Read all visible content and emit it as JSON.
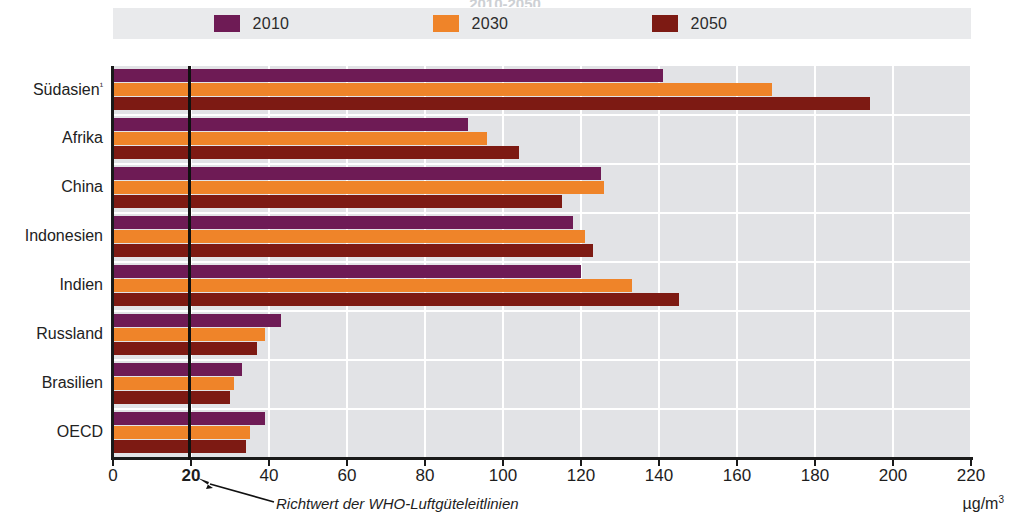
{
  "title_remnant": "2010-2050",
  "legend": {
    "items": [
      {
        "label": "2010",
        "color": "#6e1b55",
        "icon": "legend-swatch-icon"
      },
      {
        "label": "2030",
        "color": "#ef8429",
        "icon": "legend-swatch-icon"
      },
      {
        "label": "2050",
        "color": "#7d1a13",
        "icon": "legend-swatch-icon"
      }
    ]
  },
  "annotation": {
    "text": "Richtwert der WHO-Luftgüteleitlinien",
    "reference_value": 20,
    "arrow_icon": "arrow-up-left-icon"
  },
  "unit": "µg/m",
  "unit_exponent": "3",
  "axis": {
    "x_ticks": [
      "0",
      "20",
      "40",
      "60",
      "80",
      "100",
      "120",
      "140",
      "160",
      "180",
      "200",
      "220"
    ],
    "x_bold_tick": "20"
  },
  "chart_data": {
    "type": "bar",
    "orientation": "horizontal",
    "title": "",
    "xlabel": "µg/m³",
    "ylabel": "",
    "xlim": [
      0,
      220
    ],
    "xtick_step": 20,
    "grid": true,
    "legend_position": "top",
    "categories": [
      "Südasien¹",
      "Afrika",
      "China",
      "Indonesien",
      "Indien",
      "Russland",
      "Brasilien",
      "OECD"
    ],
    "series": [
      {
        "name": "2010",
        "color": "#6e1b55",
        "values": [
          141,
          91,
          125,
          118,
          120,
          43,
          33,
          39
        ]
      },
      {
        "name": "2030",
        "color": "#ef8429",
        "values": [
          169,
          96,
          126,
          121,
          133,
          39,
          31,
          35
        ]
      },
      {
        "name": "2050",
        "color": "#7d1a13",
        "values": [
          194,
          104,
          115,
          123,
          145,
          37,
          30,
          34
        ]
      }
    ],
    "reference_line": {
      "label": "Richtwert der WHO-Luftgüteleitlinien",
      "value": 20,
      "color": "#111111"
    }
  }
}
